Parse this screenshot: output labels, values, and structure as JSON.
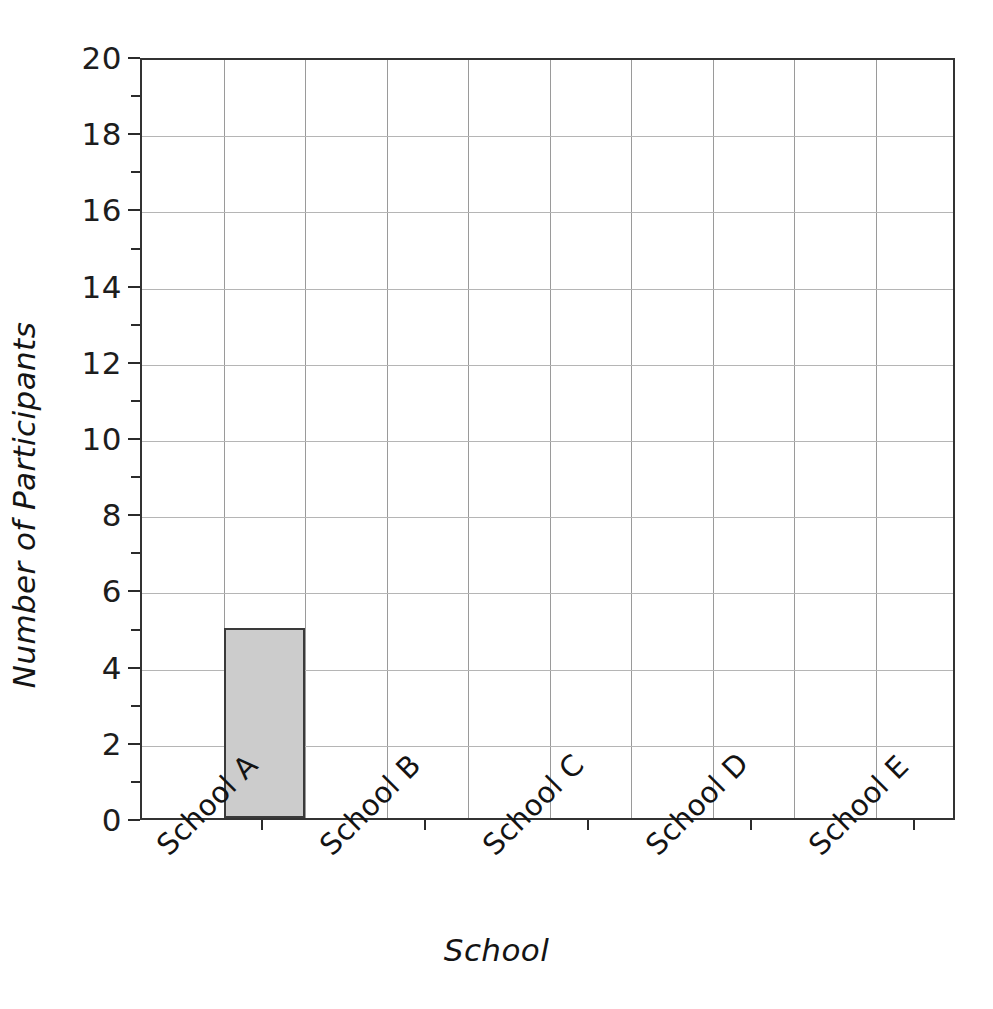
{
  "chart_data": {
    "type": "bar",
    "title": "",
    "xlabel": "School",
    "ylabel": "Number of Participants",
    "categories": [
      "School A",
      "School B",
      "School C",
      "School D",
      "School E"
    ],
    "values": [
      5,
      0,
      0,
      0,
      0
    ],
    "series": [
      {
        "name": "Number of Participants",
        "values": [
          5,
          0,
          0,
          0,
          0
        ]
      }
    ],
    "ylim": [
      0,
      20
    ],
    "y_major_ticks": [
      0,
      2,
      4,
      6,
      8,
      10,
      12,
      14,
      16,
      18,
      20
    ],
    "y_minor_ticks": [
      1,
      3,
      5,
      7,
      9,
      11,
      13,
      15,
      17,
      19
    ],
    "y_tick_labels": [
      "0",
      "2",
      "4",
      "6",
      "8",
      "10",
      "12",
      "14",
      "16",
      "18",
      "20"
    ],
    "grid": "both",
    "vertical_gridline_count": 10,
    "legend": "none",
    "legend_position": "none",
    "bar_fill_color": "#cccccc",
    "bar_edge_color": "#3a3a3a",
    "grid_color": "#b5b5b5",
    "axis_color": "#333333",
    "background_color": "#ffffff",
    "xtick_label_rotation": -45
  },
  "axes": {
    "y_title": "Number of Participants",
    "x_title": "School"
  }
}
